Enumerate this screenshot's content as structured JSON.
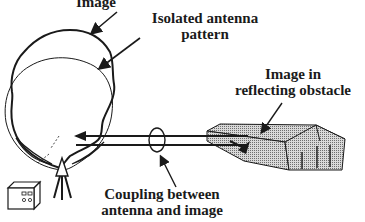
{
  "labels": {
    "image_line1": "Image",
    "isolated_line1": "Isolated antenna",
    "isolated_line2": "pattern",
    "reflect_line1": "Image in",
    "reflect_line2": "reflecting obstacle",
    "coupling_line1": "Coupling between",
    "coupling_line2": "antenna and image"
  },
  "colors": {
    "ink": "#1a1a1a",
    "obstacle_fill": "#a8a8a8",
    "background": "#ffffff"
  },
  "icons": {
    "antenna": "antenna-icon",
    "transmitter": "transmitter-box-icon",
    "obstacle": "building-obstacle-icon"
  }
}
